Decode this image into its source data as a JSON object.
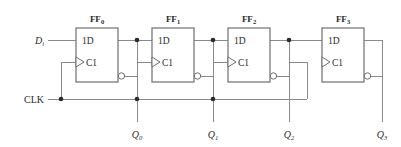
{
  "diagram": {
    "kind": "logic-circuit-schematic",
    "colors": {
      "wire": "#8a8a8a",
      "outline": "#6e6e6e",
      "text": "#2b2b2b",
      "background": "#ffffff"
    },
    "inputs": [
      {
        "name": "data-input",
        "label": "D",
        "subscript": "i"
      },
      {
        "name": "clock-input",
        "label": "CLK",
        "subscript": ""
      }
    ],
    "flipflops": [
      {
        "id": "ff0",
        "label": "FF",
        "subscript": "0",
        "data_pin": "1D",
        "clock_pin": "C1",
        "output_label": "Q",
        "output_subscript": "0"
      },
      {
        "id": "ff1",
        "label": "FF",
        "subscript": "1",
        "data_pin": "1D",
        "clock_pin": "C1",
        "output_label": "Q",
        "output_subscript": "1"
      },
      {
        "id": "ff2",
        "label": "FF",
        "subscript": "2",
        "data_pin": "1D",
        "clock_pin": "C1",
        "output_label": "Q",
        "output_subscript": "2"
      },
      {
        "id": "ff3",
        "label": "FF",
        "subscript": "3",
        "data_pin": "1D",
        "clock_pin": "C1",
        "output_label": "Q",
        "output_subscript": "3"
      }
    ]
  }
}
